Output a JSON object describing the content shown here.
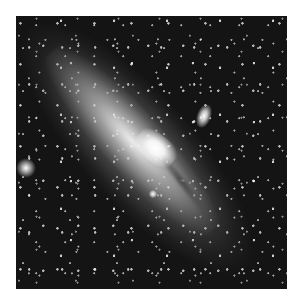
{
  "image": {
    "subject": "spiral galaxy (Andromeda-like) with companion galaxy and field stars",
    "style": "grayscale astronomical photograph",
    "background_color": "#ffffff",
    "photo_bounds": {
      "left": 16,
      "top": 16,
      "width": 271,
      "height": 273
    }
  }
}
